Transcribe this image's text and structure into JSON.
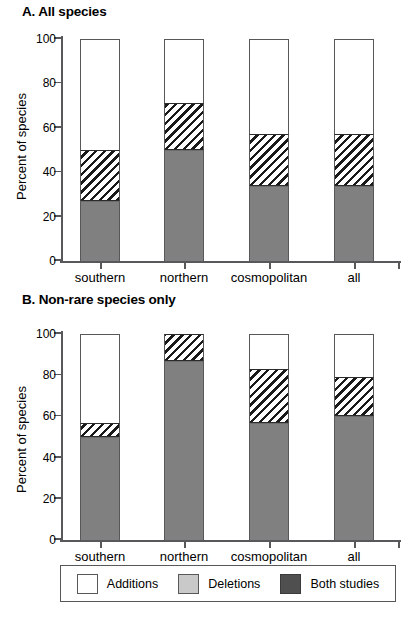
{
  "figure": {
    "ylabel": "Percent of species"
  },
  "panels": [
    {
      "id": "A",
      "title": "A. All species",
      "ylabel": "Percent of species",
      "yticks": [
        "0",
        "20",
        "40",
        "60",
        "80",
        "100"
      ],
      "categories": [
        "southern",
        "northern",
        "cosmopolitan",
        "all"
      ]
    },
    {
      "id": "B",
      "title": "B. Non-rare species only",
      "ylabel": "Percent of species",
      "yticks": [
        "0",
        "20",
        "40",
        "60",
        "80",
        "100"
      ],
      "categories": [
        "southern",
        "northern",
        "cosmopolitan",
        "all"
      ]
    }
  ],
  "legend": {
    "items": [
      {
        "label": "Additions",
        "swatch": "white",
        "color": "#ffffff"
      },
      {
        "label": "Deletions",
        "swatch": "light-gray",
        "color": "#c9c9c9"
      },
      {
        "label": "Both studies",
        "swatch": "dark-gray",
        "color": "#4f4f4f"
      }
    ]
  },
  "chart_data": [
    {
      "type": "bar",
      "stacked": true,
      "title": "A. All species",
      "xlabel": "",
      "ylabel": "Percent of species",
      "ylim": [
        0,
        100
      ],
      "yticks": [
        0,
        20,
        40,
        60,
        80,
        100
      ],
      "grid": false,
      "legend_position": "bottom",
      "categories": [
        "southern",
        "northern",
        "cosmopolitan",
        "all"
      ],
      "series": [
        {
          "name": "Both studies",
          "values": [
            27,
            50,
            34,
            34
          ]
        },
        {
          "name": "Deletions",
          "values": [
            23,
            21,
            23,
            23
          ]
        },
        {
          "name": "Additions",
          "values": [
            50,
            29,
            43,
            43
          ]
        }
      ],
      "cumulative_tops": {
        "Both studies": [
          27,
          50,
          34,
          34
        ],
        "Deletions": [
          50,
          71,
          57,
          57
        ],
        "Additions": [
          100,
          100,
          100,
          100
        ]
      }
    },
    {
      "type": "bar",
      "stacked": true,
      "title": "B. Non-rare species only",
      "xlabel": "",
      "ylabel": "Percent of species",
      "ylim": [
        0,
        100
      ],
      "yticks": [
        0,
        20,
        40,
        60,
        80,
        100
      ],
      "grid": false,
      "legend_position": "bottom",
      "categories": [
        "southern",
        "northern",
        "cosmopolitan",
        "all"
      ],
      "series": [
        {
          "name": "Both studies",
          "values": [
            50,
            87,
            57,
            60
          ]
        },
        {
          "name": "Deletions",
          "values": [
            7,
            13,
            26,
            19
          ]
        },
        {
          "name": "Additions",
          "values": [
            43,
            0,
            17,
            21
          ]
        }
      ],
      "cumulative_tops": {
        "Both studies": [
          50,
          87,
          57,
          60
        ],
        "Deletions": [
          57,
          100,
          83,
          79
        ],
        "Additions": [
          100,
          100,
          100,
          100
        ]
      }
    }
  ],
  "layout": {
    "bar_width_px": 40,
    "bar_centers_px": [
      100,
      184,
      269,
      354
    ]
  }
}
